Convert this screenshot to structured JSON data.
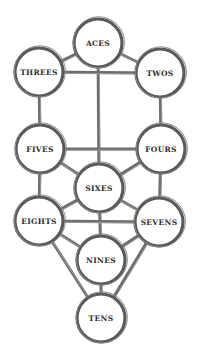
{
  "diagram": {
    "title": "",
    "colors": {
      "stroke": "#5a5a5a",
      "text": "#2f2f2f",
      "background": "#ffffff"
    },
    "nodes": [
      {
        "id": "aces",
        "label": "ACES",
        "x": 98,
        "y": 43,
        "r": 24
      },
      {
        "id": "threes",
        "label": "THREES",
        "x": 39,
        "y": 72,
        "r": 24
      },
      {
        "id": "twos",
        "label": "TWOS",
        "x": 160,
        "y": 73,
        "r": 24
      },
      {
        "id": "fives",
        "label": "FIVES",
        "x": 40,
        "y": 149,
        "r": 24
      },
      {
        "id": "fours",
        "label": "FOURS",
        "x": 161,
        "y": 149,
        "r": 24
      },
      {
        "id": "sixes",
        "label": "SIXES",
        "x": 99,
        "y": 188,
        "r": 24
      },
      {
        "id": "eights",
        "label": "EIGHTS",
        "x": 39,
        "y": 221,
        "r": 24
      },
      {
        "id": "sevens",
        "label": "SEVENS",
        "x": 159,
        "y": 222,
        "r": 24
      },
      {
        "id": "nines",
        "label": "NINES",
        "x": 101,
        "y": 260,
        "r": 24
      },
      {
        "id": "tens",
        "label": "TENS",
        "x": 101,
        "y": 318,
        "r": 24
      }
    ],
    "edges": [
      [
        "aces",
        "threes"
      ],
      [
        "aces",
        "twos"
      ],
      [
        "aces",
        "sixes"
      ],
      [
        "threes",
        "twos"
      ],
      [
        "threes",
        "fives"
      ],
      [
        "twos",
        "fours"
      ],
      [
        "fives",
        "fours"
      ],
      [
        "fives",
        "sixes"
      ],
      [
        "fours",
        "sixes"
      ],
      [
        "fives",
        "eights"
      ],
      [
        "fours",
        "sevens"
      ],
      [
        "sixes",
        "eights"
      ],
      [
        "sixes",
        "sevens"
      ],
      [
        "sixes",
        "nines"
      ],
      [
        "eights",
        "sevens"
      ],
      [
        "eights",
        "nines"
      ],
      [
        "sevens",
        "nines"
      ],
      [
        "eights",
        "tens"
      ],
      [
        "sevens",
        "tens"
      ],
      [
        "nines",
        "tens"
      ]
    ]
  }
}
